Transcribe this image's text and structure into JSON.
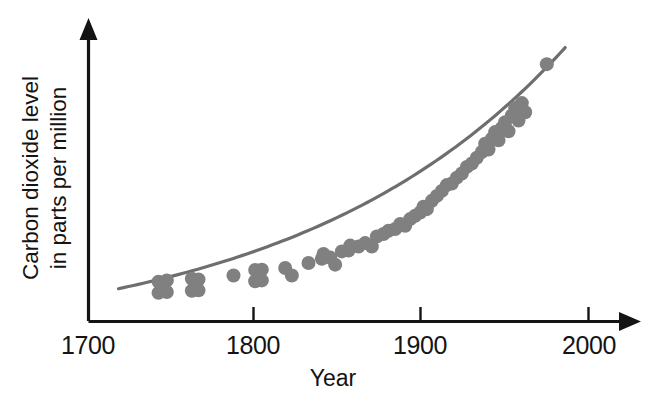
{
  "chart_data": {
    "type": "scatter",
    "title": "",
    "subtitle": "",
    "xlabel": "Year",
    "ylabel": "Carbon dioxide level in parts per million",
    "ylabel_line1": "Carbon dioxide level",
    "ylabel_line2": "in parts per million",
    "xlim": [
      1700,
      2010
    ],
    "ylim": [
      268,
      338
    ],
    "x_ticks": [
      1700,
      1800,
      1900,
      2000
    ],
    "x_tick_labels": [
      "1700",
      "1800",
      "1900",
      "2000"
    ],
    "y_ticks": [],
    "y_tick_labels": [],
    "grid": false,
    "legend": false,
    "legend_position": "none",
    "axis_style": "arrow-ended L-frame, no y tick marks, no y tick labels",
    "point_color": "#808080",
    "point_radius_px": 7,
    "curve_color": "#6e6e6e",
    "curve_width_px": 3.2,
    "axis_color": "#141414",
    "background_color": "#ffffff",
    "annotations": [],
    "series": [
      {
        "name": "Carbon dioxide measurements",
        "marker": "filled-circle",
        "points": [
          {
            "x": 1742,
            "y": 277.5
          },
          {
            "x": 1742,
            "y": 274.8
          },
          {
            "x": 1747,
            "y": 277.8
          },
          {
            "x": 1747,
            "y": 275.0
          },
          {
            "x": 1762,
            "y": 278.2
          },
          {
            "x": 1762,
            "y": 275.3
          },
          {
            "x": 1766,
            "y": 278.0
          },
          {
            "x": 1766,
            "y": 275.4
          },
          {
            "x": 1787,
            "y": 279.0
          },
          {
            "x": 1800,
            "y": 280.3
          },
          {
            "x": 1800,
            "y": 277.6
          },
          {
            "x": 1804,
            "y": 280.4
          },
          {
            "x": 1804,
            "y": 277.8
          },
          {
            "x": 1818,
            "y": 280.8
          },
          {
            "x": 1822,
            "y": 279.0
          },
          {
            "x": 1832,
            "y": 282.0
          },
          {
            "x": 1840,
            "y": 283.0
          },
          {
            "x": 1841,
            "y": 284.2
          },
          {
            "x": 1845,
            "y": 283.3
          },
          {
            "x": 1848,
            "y": 281.6
          },
          {
            "x": 1852,
            "y": 284.8
          },
          {
            "x": 1856,
            "y": 285.0
          },
          {
            "x": 1857,
            "y": 286.2
          },
          {
            "x": 1862,
            "y": 286.0
          },
          {
            "x": 1866,
            "y": 286.8
          },
          {
            "x": 1870,
            "y": 286.0
          },
          {
            "x": 1873,
            "y": 288.4
          },
          {
            "x": 1877,
            "y": 289.0
          },
          {
            "x": 1880,
            "y": 289.8
          },
          {
            "x": 1884,
            "y": 290.2
          },
          {
            "x": 1887,
            "y": 291.4
          },
          {
            "x": 1890,
            "y": 291.0
          },
          {
            "x": 1893,
            "y": 292.6
          },
          {
            "x": 1896,
            "y": 293.4
          },
          {
            "x": 1899,
            "y": 294.2
          },
          {
            "x": 1901,
            "y": 295.6
          },
          {
            "x": 1903,
            "y": 295.0
          },
          {
            "x": 1906,
            "y": 297.0
          },
          {
            "x": 1909,
            "y": 298.2
          },
          {
            "x": 1912,
            "y": 299.4
          },
          {
            "x": 1915,
            "y": 300.8
          },
          {
            "x": 1918,
            "y": 301.2
          },
          {
            "x": 1921,
            "y": 302.6
          },
          {
            "x": 1924,
            "y": 303.6
          },
          {
            "x": 1927,
            "y": 305.2
          },
          {
            "x": 1930,
            "y": 306.0
          },
          {
            "x": 1933,
            "y": 307.4
          },
          {
            "x": 1936,
            "y": 308.8
          },
          {
            "x": 1938,
            "y": 310.8
          },
          {
            "x": 1940,
            "y": 309.4
          },
          {
            "x": 1942,
            "y": 312.0
          },
          {
            "x": 1944,
            "y": 313.6
          },
          {
            "x": 1946,
            "y": 311.6
          },
          {
            "x": 1948,
            "y": 314.6
          },
          {
            "x": 1950,
            "y": 316.0
          },
          {
            "x": 1952,
            "y": 313.8
          },
          {
            "x": 1954,
            "y": 317.6
          },
          {
            "x": 1956,
            "y": 319.4
          },
          {
            "x": 1958,
            "y": 316.4
          },
          {
            "x": 1960,
            "y": 320.6
          },
          {
            "x": 1962,
            "y": 318.4
          },
          {
            "x": 1975,
            "y": 330.0
          }
        ]
      }
    ],
    "trend": {
      "name": "fitted exponential trend curve",
      "visible": true,
      "x_start": 1718,
      "x_end": 1986,
      "y_start": 275.8,
      "y_end": 334.0
    }
  }
}
